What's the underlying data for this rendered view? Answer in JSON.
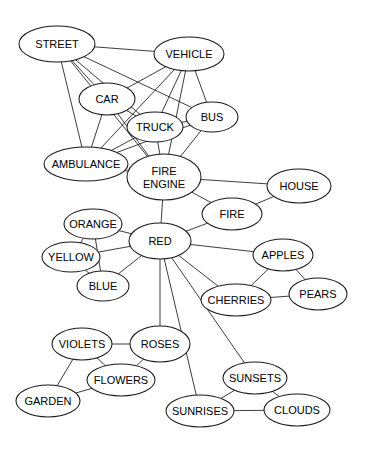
{
  "diagram": {
    "type": "node-link-graph",
    "width": 370,
    "height": 452,
    "background_color": "#ffffff",
    "node_fill": "#ffffff",
    "node_stroke": "#1a1a1a",
    "edge_stroke": "#1a1a1a",
    "label_color": "#000000"
  },
  "nodes": [
    {
      "id": "street",
      "label": "STREET",
      "cx": 57,
      "cy": 44,
      "rx": 38,
      "ry": 18,
      "font_size": 11
    },
    {
      "id": "vehicle",
      "label": "VEHICLE",
      "cx": 189,
      "cy": 54,
      "rx": 35,
      "ry": 17,
      "font_size": 11
    },
    {
      "id": "car",
      "label": "CAR",
      "cx": 107,
      "cy": 99,
      "rx": 28,
      "ry": 16,
      "font_size": 11
    },
    {
      "id": "truck",
      "label": "TRUCK",
      "cx": 155,
      "cy": 127,
      "rx": 28,
      "ry": 15,
      "font_size": 11
    },
    {
      "id": "bus",
      "label": "BUS",
      "cx": 212,
      "cy": 117,
      "rx": 26,
      "ry": 15,
      "font_size": 11
    },
    {
      "id": "ambulance",
      "label": "AMBULANCE",
      "cx": 86,
      "cy": 164,
      "rx": 42,
      "ry": 17,
      "font_size": 11
    },
    {
      "id": "fire_engine",
      "label": "FIRE\nENGINE",
      "cx": 164,
      "cy": 177,
      "rx": 37,
      "ry": 23,
      "font_size": 11
    },
    {
      "id": "house",
      "label": "HOUSE",
      "cx": 299,
      "cy": 186,
      "rx": 32,
      "ry": 17,
      "font_size": 11
    },
    {
      "id": "fire",
      "label": "FIRE",
      "cx": 232,
      "cy": 214,
      "rx": 30,
      "ry": 16,
      "font_size": 11
    },
    {
      "id": "orange",
      "label": "ORANGE",
      "cx": 93,
      "cy": 224,
      "rx": 29,
      "ry": 15,
      "font_size": 11
    },
    {
      "id": "red",
      "label": "RED",
      "cx": 160,
      "cy": 241,
      "rx": 31,
      "ry": 18,
      "font_size": 11
    },
    {
      "id": "yellow",
      "label": "YELLOW",
      "cx": 71,
      "cy": 257,
      "rx": 29,
      "ry": 15,
      "font_size": 11
    },
    {
      "id": "blue",
      "label": "BLUE",
      "cx": 103,
      "cy": 286,
      "rx": 26,
      "ry": 15,
      "font_size": 11
    },
    {
      "id": "apples",
      "label": "APPLES",
      "cx": 283,
      "cy": 255,
      "rx": 30,
      "ry": 16,
      "font_size": 11
    },
    {
      "id": "pears",
      "label": "PEARS",
      "cx": 318,
      "cy": 294,
      "rx": 29,
      "ry": 16,
      "font_size": 11
    },
    {
      "id": "cherries",
      "label": "CHERRIES",
      "cx": 236,
      "cy": 300,
      "rx": 35,
      "ry": 16,
      "font_size": 11
    },
    {
      "id": "violets",
      "label": "VIOLETS",
      "cx": 82,
      "cy": 344,
      "rx": 30,
      "ry": 16,
      "font_size": 11
    },
    {
      "id": "roses",
      "label": "ROSES",
      "cx": 160,
      "cy": 344,
      "rx": 30,
      "ry": 18,
      "font_size": 11
    },
    {
      "id": "flowers",
      "label": "FLOWERS",
      "cx": 121,
      "cy": 380,
      "rx": 34,
      "ry": 16,
      "font_size": 11
    },
    {
      "id": "garden",
      "label": "GARDEN",
      "cx": 48,
      "cy": 401,
      "rx": 32,
      "ry": 16,
      "font_size": 11
    },
    {
      "id": "sunsets",
      "label": "SUNSETS",
      "cx": 255,
      "cy": 378,
      "rx": 32,
      "ry": 16,
      "font_size": 11
    },
    {
      "id": "sunrises",
      "label": "SUNRISES",
      "cx": 200,
      "cy": 411,
      "rx": 34,
      "ry": 16,
      "font_size": 11
    },
    {
      "id": "clouds",
      "label": "CLOUDS",
      "cx": 297,
      "cy": 410,
      "rx": 33,
      "ry": 16,
      "font_size": 11
    }
  ],
  "edges": [
    {
      "source": "street",
      "target": "vehicle"
    },
    {
      "source": "street",
      "target": "car"
    },
    {
      "source": "street",
      "target": "truck"
    },
    {
      "source": "street",
      "target": "bus"
    },
    {
      "source": "street",
      "target": "ambulance"
    },
    {
      "source": "street",
      "target": "fire_engine"
    },
    {
      "source": "vehicle",
      "target": "car"
    },
    {
      "source": "vehicle",
      "target": "truck"
    },
    {
      "source": "vehicle",
      "target": "bus"
    },
    {
      "source": "vehicle",
      "target": "ambulance"
    },
    {
      "source": "vehicle",
      "target": "fire_engine"
    },
    {
      "source": "car",
      "target": "truck"
    },
    {
      "source": "car",
      "target": "ambulance"
    },
    {
      "source": "car",
      "target": "fire_engine"
    },
    {
      "source": "truck",
      "target": "bus"
    },
    {
      "source": "truck",
      "target": "ambulance"
    },
    {
      "source": "truck",
      "target": "fire_engine"
    },
    {
      "source": "bus",
      "target": "ambulance"
    },
    {
      "source": "bus",
      "target": "fire_engine"
    },
    {
      "source": "ambulance",
      "target": "fire_engine"
    },
    {
      "source": "fire_engine",
      "target": "house"
    },
    {
      "source": "fire_engine",
      "target": "fire"
    },
    {
      "source": "fire_engine",
      "target": "red"
    },
    {
      "source": "house",
      "target": "fire"
    },
    {
      "source": "fire",
      "target": "red"
    },
    {
      "source": "red",
      "target": "orange"
    },
    {
      "source": "red",
      "target": "yellow"
    },
    {
      "source": "red",
      "target": "blue"
    },
    {
      "source": "red",
      "target": "apples"
    },
    {
      "source": "red",
      "target": "cherries"
    },
    {
      "source": "red",
      "target": "roses"
    },
    {
      "source": "red",
      "target": "sunsets"
    },
    {
      "source": "red",
      "target": "sunrises"
    },
    {
      "source": "orange",
      "target": "yellow"
    },
    {
      "source": "orange",
      "target": "blue"
    },
    {
      "source": "yellow",
      "target": "blue"
    },
    {
      "source": "apples",
      "target": "cherries"
    },
    {
      "source": "apples",
      "target": "pears"
    },
    {
      "source": "cherries",
      "target": "pears"
    },
    {
      "source": "violets",
      "target": "roses"
    },
    {
      "source": "violets",
      "target": "flowers"
    },
    {
      "source": "violets",
      "target": "garden"
    },
    {
      "source": "roses",
      "target": "flowers"
    },
    {
      "source": "flowers",
      "target": "garden"
    },
    {
      "source": "sunsets",
      "target": "sunrises"
    },
    {
      "source": "sunsets",
      "target": "clouds"
    },
    {
      "source": "sunrises",
      "target": "clouds"
    }
  ]
}
